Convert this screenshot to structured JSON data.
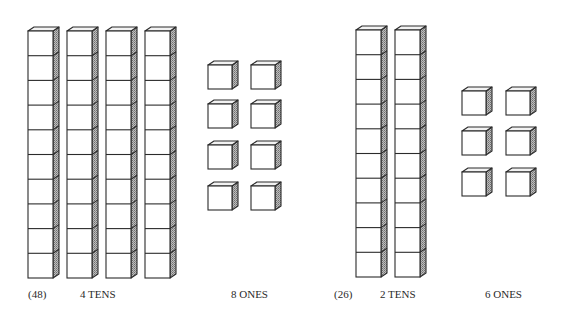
{
  "colors": {
    "stroke": "#2b2b2b",
    "face": "#ffffff",
    "side": "#9a9a9a",
    "top": "#f2f2f2"
  },
  "groups": [
    {
      "number_label": "(48)",
      "tens_label": "4 TENS",
      "ones_label": "8 ONES",
      "tens_count": 4,
      "ones_count": 8,
      "rods_x": [
        28,
        67,
        106,
        145
      ],
      "rod_top": 31,
      "rod_bottom": 278,
      "ones_cols_x": [
        208,
        251
      ],
      "ones_rows_y": [
        65,
        104,
        145,
        186
      ],
      "ones_size": 24
    },
    {
      "number_label": "(26)",
      "tens_label": "2 TENS",
      "ones_label": "6 ONES",
      "tens_count": 2,
      "ones_count": 6,
      "rods_x": [
        356,
        395
      ],
      "rod_top": 30,
      "rod_bottom": 277,
      "ones_cols_x": [
        462,
        506
      ],
      "ones_rows_y": [
        91,
        131,
        172
      ],
      "ones_size": 24
    }
  ],
  "rod": {
    "width": 25,
    "cubes": 10,
    "depth_x": 6,
    "depth_y": 4
  }
}
